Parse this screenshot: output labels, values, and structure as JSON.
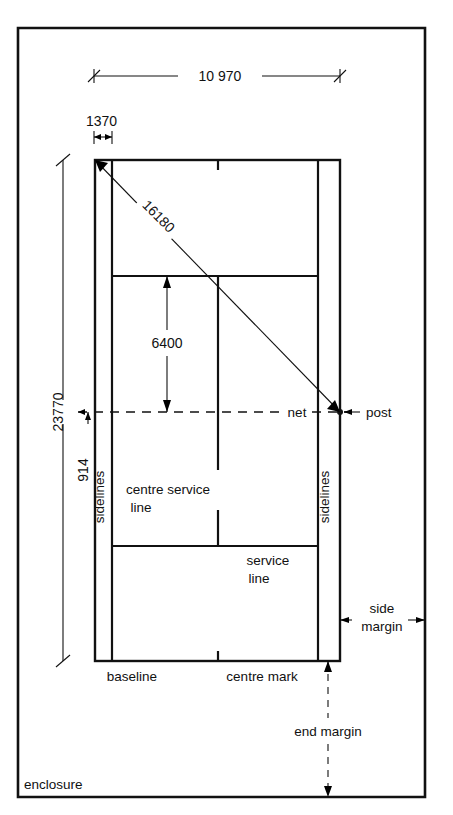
{
  "diagram": {
    "units_note": "millimetres",
    "dimensions": {
      "court_width_doubles": "10 970",
      "alley_width": "1370",
      "court_length": "23770",
      "alley_label_914": "914",
      "service_line_to_net": "6400",
      "diagonal": "16180"
    },
    "labels": {
      "net": "net",
      "post": "post",
      "sidelines_left": "sidelines",
      "sidelines_right": "sidelines",
      "centre_service_line": "centre service\nline",
      "centre_service_line_l1": "centre service",
      "centre_service_line_l2": "line",
      "service_line_l1": "service",
      "service_line_l2": "line",
      "baseline": "baseline",
      "centre_mark": "centre mark",
      "side_margin_l1": "side",
      "side_margin_l2": "margin",
      "end_margin": "end margin",
      "enclosure": "enclosure"
    },
    "colors": {
      "ink": "#111111",
      "paper": "#ffffff"
    }
  }
}
